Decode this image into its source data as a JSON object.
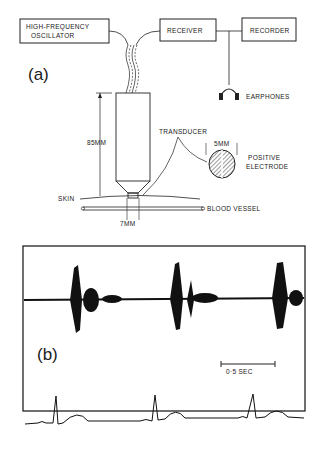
{
  "panel_a": {
    "label": "(a)",
    "blocks": {
      "oscillator_line1": "HIGH-FREQUENCY",
      "oscillator_line2": "OSCILLATOR",
      "receiver": "RECEIVER",
      "recorder": "RECORDER"
    },
    "earphones": "EARPHONES",
    "probe_length": "85MM",
    "transducer": "TRANSDUCER",
    "electrode_width": "5MM",
    "electrode_line1": "POSITIVE",
    "electrode_line2": "ELECTRODE",
    "skin": "SKIN",
    "blood_vessel": "BLOOD VESSEL",
    "tip_width": "7MM"
  },
  "panel_b": {
    "label": "(b)",
    "scale_bar": "0·5 SEC",
    "traces": [
      "doppler audio signal",
      "ECG"
    ]
  }
}
